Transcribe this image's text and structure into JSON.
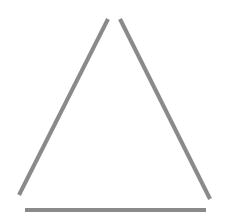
{
  "diagram": {
    "shape": "open-triangle",
    "stroke_color": "#8a8a8a",
    "stroke_width": 4,
    "lines": [
      {
        "name": "left-side",
        "x1": 108,
        "y1": 19,
        "x2": 19,
        "y2": 195
      },
      {
        "name": "right-side",
        "x1": 120,
        "y1": 19,
        "x2": 210,
        "y2": 199
      },
      {
        "name": "base",
        "x1": 25,
        "y1": 210,
        "x2": 206,
        "y2": 210
      }
    ]
  }
}
